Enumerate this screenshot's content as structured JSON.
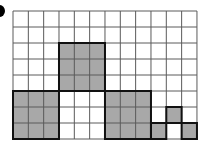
{
  "diagram": {
    "type": "grid-area-figure",
    "columns": 12,
    "rows": 8,
    "cell_size": 15.33,
    "row_height": 16,
    "colors": {
      "shade": "#a8a8a8",
      "grid_line": "#5a5a5a",
      "outline": "#111111",
      "background": "#ffffff",
      "bullet": "#000000"
    },
    "shapes": [
      {
        "name": "tall-square-block",
        "col": 3,
        "row": 2,
        "w": 3,
        "h": 3
      },
      {
        "name": "left-square-block",
        "col": 0,
        "row": 5,
        "w": 3,
        "h": 3
      },
      {
        "name": "right-square-block",
        "col": 6,
        "row": 5,
        "w": 3,
        "h": 3
      },
      {
        "name": "small-square-a",
        "col": 9,
        "row": 7,
        "w": 1,
        "h": 1
      },
      {
        "name": "small-square-b",
        "col": 10,
        "row": 6,
        "w": 1,
        "h": 1
      },
      {
        "name": "small-square-c",
        "col": 11,
        "row": 7,
        "w": 1,
        "h": 1
      }
    ]
  }
}
